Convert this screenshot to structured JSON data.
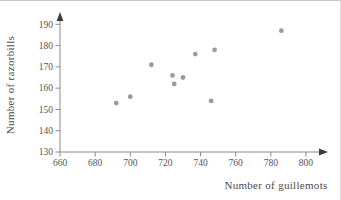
{
  "chart_data": {
    "type": "scatter",
    "title": "",
    "xlabel": "Number of guillemots",
    "ylabel": "Number of razorbills",
    "x_ticks": [
      660,
      680,
      700,
      720,
      740,
      760,
      780,
      800
    ],
    "y_ticks": [
      130,
      140,
      150,
      160,
      170,
      180,
      190
    ],
    "xlim": [
      660,
      810
    ],
    "ylim": [
      130,
      195
    ],
    "grid": false,
    "legend": null,
    "point_color": "#9a9a9a",
    "axis_color": "#8a8a8a",
    "arrow_color": "#3a3a3a",
    "text_color": "#555555",
    "points": [
      {
        "x": 692,
        "y": 153
      },
      {
        "x": 700,
        "y": 156
      },
      {
        "x": 712,
        "y": 171
      },
      {
        "x": 724,
        "y": 166
      },
      {
        "x": 725,
        "y": 162
      },
      {
        "x": 730,
        "y": 165
      },
      {
        "x": 737,
        "y": 176
      },
      {
        "x": 746,
        "y": 154
      },
      {
        "x": 748,
        "y": 178
      },
      {
        "x": 786,
        "y": 187
      }
    ]
  }
}
